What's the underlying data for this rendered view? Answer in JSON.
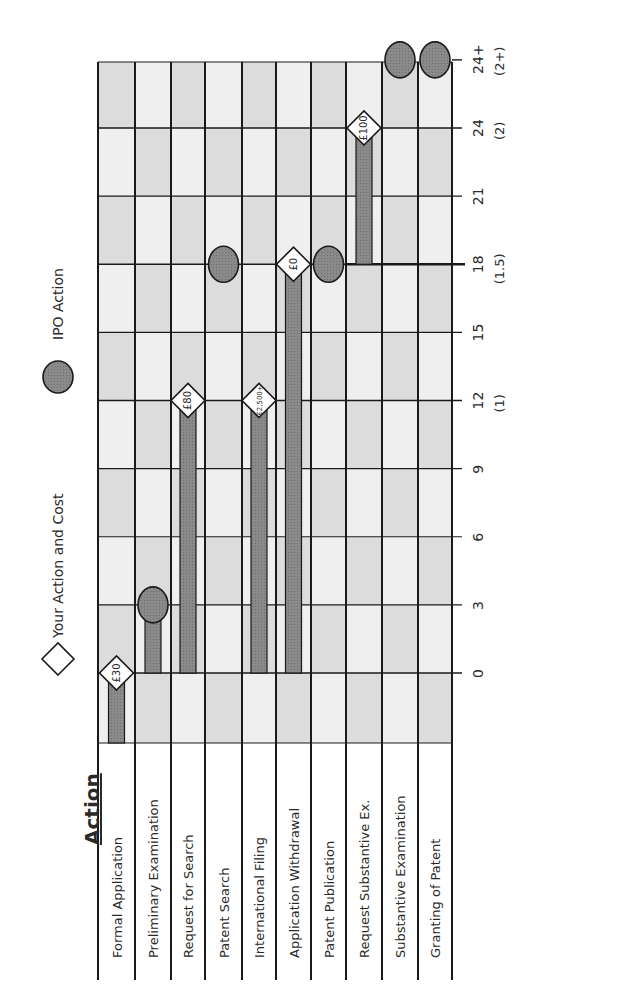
{
  "title": "Action",
  "legend": [
    {
      "symbol": "diamond",
      "label": "Your Action and Cost"
    },
    {
      "symbol": "circle",
      "label": "IPO Action"
    }
  ],
  "colors": {
    "grid_line": "#1a1a1a",
    "cell_light": "#efefef",
    "cell_mid": "#dcdcdc",
    "bar_fill": "#8a8a8a",
    "circle_fill": "#8c8c8c",
    "diamond_fill": "#ffffff"
  },
  "chart_data": {
    "type": "bar",
    "title": "Action",
    "orientation": "rotated 90° counter-clockwise (timeline Gantt-style)",
    "xlabel": "Months (years)",
    "ylabel": "Action",
    "x_ticks": [
      {
        "value": 0,
        "label": "0",
        "sub": ""
      },
      {
        "value": 3,
        "label": "3",
        "sub": ""
      },
      {
        "value": 6,
        "label": "6",
        "sub": ""
      },
      {
        "value": 9,
        "label": "9",
        "sub": ""
      },
      {
        "value": 12,
        "label": "12",
        "sub": "(1)"
      },
      {
        "value": 15,
        "label": "15",
        "sub": ""
      },
      {
        "value": 18,
        "label": "18",
        "sub": "(1.5)"
      },
      {
        "value": 21,
        "label": "21",
        "sub": ""
      },
      {
        "value": 24,
        "label": "24",
        "sub": "(2)"
      },
      {
        "value": 27,
        "label": "24+",
        "sub": "(2+)"
      }
    ],
    "categories": [
      "Formal Application",
      "Preliminary Examination",
      "Request for Search",
      "Patent Search",
      "International Filing",
      "Application Withdrawal",
      "Patent Publication",
      "Request Substantive Ex.",
      "Substantive Examination",
      "Granting of Patent"
    ],
    "events": [
      {
        "action": "Formal Application",
        "type": "your_action",
        "start": -2,
        "month": 0,
        "cost": "£30"
      },
      {
        "action": "Preliminary Examination",
        "type": "ipo_action",
        "start": 0,
        "month": 3,
        "cost": ""
      },
      {
        "action": "Request for Search",
        "type": "your_action",
        "start": 0,
        "month": 12,
        "cost": "£80"
      },
      {
        "action": "Patent Search",
        "type": "ipo_action",
        "start": null,
        "month": 18,
        "cost": ""
      },
      {
        "action": "International Filing",
        "type": "your_action",
        "start": 0,
        "month": 12,
        "cost": "£2,500+"
      },
      {
        "action": "Application Withdrawal",
        "type": "your_action",
        "start": 0,
        "month": 18,
        "cost": "£0"
      },
      {
        "action": "Patent Publication",
        "type": "ipo_action",
        "start": null,
        "month": 18,
        "cost": ""
      },
      {
        "action": "Request Substantive Ex.",
        "type": "your_action",
        "start": 18,
        "month": 24,
        "cost": "£100"
      },
      {
        "action": "Substantive Examination",
        "type": "ipo_action",
        "start": null,
        "month": 27,
        "cost": ""
      },
      {
        "action": "Granting of Patent",
        "type": "ipo_action",
        "start": null,
        "month": 27,
        "cost": ""
      }
    ],
    "grid": true,
    "legend_position": "top (left side when rotated)"
  }
}
